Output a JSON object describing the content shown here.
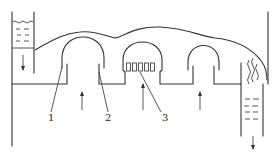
{
  "diagram": {
    "type": "schematic",
    "labels": [
      {
        "id": "1",
        "text": "1"
      },
      {
        "id": "2",
        "text": "2"
      },
      {
        "id": "3",
        "text": "3"
      }
    ],
    "colors": {
      "line": "#333333",
      "background": "#ffffff"
    }
  }
}
